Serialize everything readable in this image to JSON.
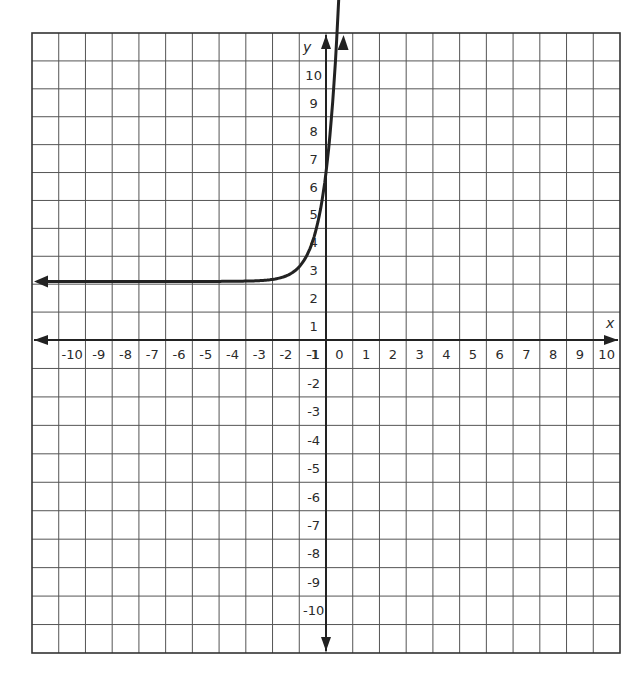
{
  "chart_data": {
    "type": "line",
    "title": "",
    "xlabel": "x",
    "ylabel": "y",
    "xlim": [
      -10,
      10
    ],
    "ylim": [
      -10,
      10
    ],
    "grid": true,
    "x_ticks": [
      "-10",
      "-9",
      "-8",
      "-7",
      "-6",
      "-5",
      "-4",
      "-3",
      "-2",
      "-1",
      "0",
      "1",
      "2",
      "3",
      "4",
      "5",
      "6",
      "7",
      "8",
      "9",
      "10"
    ],
    "y_ticks": [
      "10",
      "9",
      "8",
      "7",
      "6",
      "5",
      "4",
      "3",
      "2",
      "1",
      "-1",
      "-2",
      "-3",
      "-4",
      "-5",
      "-6",
      "-7",
      "-8",
      "-9",
      "-10"
    ],
    "series": [
      {
        "name": "exponential curve",
        "description": "Exponential growth with horizontal asymptote near y = 2, arrows on both ends",
        "asymptote_y": 2,
        "x": [
          -10.8,
          -6,
          -4,
          -3,
          -2,
          -1.5,
          -1,
          -0.5,
          0,
          0.25,
          0.5,
          0.8
        ],
        "y": [
          2.1,
          2.1,
          2.12,
          2.15,
          2.25,
          2.4,
          2.7,
          3.4,
          5.2,
          6.4,
          8.0,
          11.3
        ]
      }
    ],
    "colors": {
      "grid": "#555555",
      "axis": "#222222",
      "curve": "#222222"
    }
  }
}
